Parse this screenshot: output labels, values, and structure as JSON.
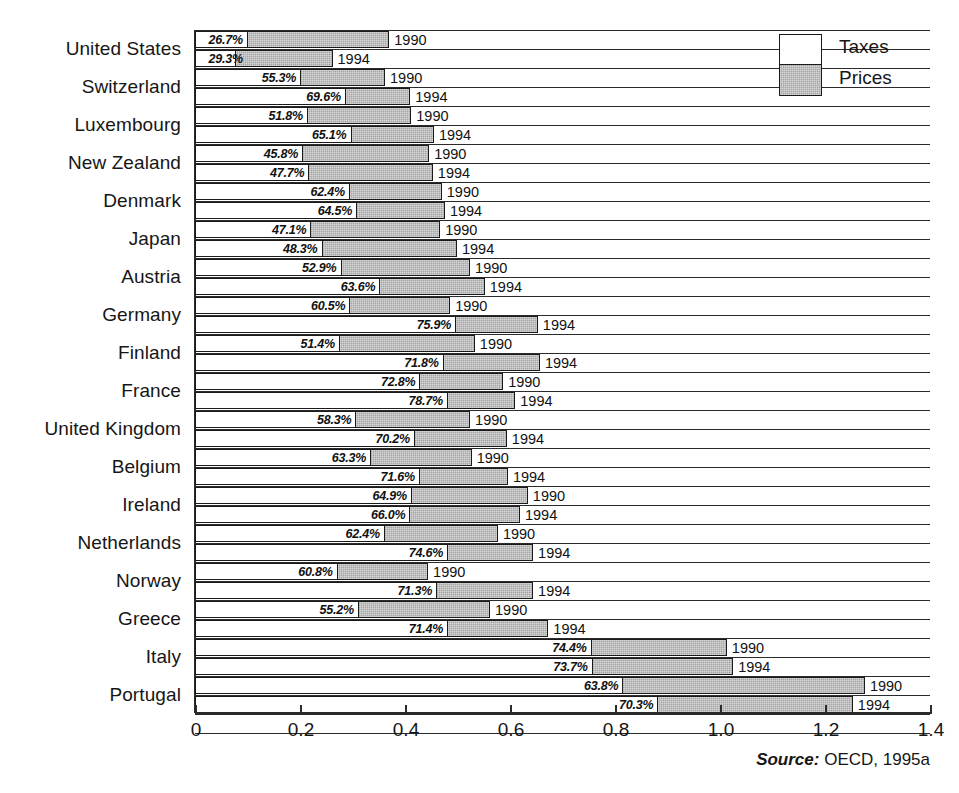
{
  "legend": {
    "position": "top-right",
    "entries": [
      {
        "label": "Taxes",
        "color": "#ffffff",
        "swatch": "white"
      },
      {
        "label": "Prices",
        "color": "#a6a6a6",
        "swatch": "gray"
      }
    ]
  },
  "source": {
    "term": "Source:",
    "text": " OECD, 1995a"
  },
  "axis": {
    "tick_labels": [
      "0",
      "0.2",
      "0.4",
      "0.6",
      "0.8",
      "1.0",
      "1.2",
      "1.4"
    ],
    "tick_values": [
      0,
      0.2,
      0.4,
      0.6,
      0.8,
      1.0,
      1.2,
      1.4
    ],
    "min": 0,
    "max": 1.4
  },
  "years": [
    "1990",
    "1994"
  ],
  "chart_data": {
    "type": "bar",
    "orientation": "horizontal",
    "stacked": true,
    "title": "",
    "subtitle": "",
    "xlabel": "",
    "ylabel": "",
    "xlim": [
      0,
      1.4
    ],
    "grid": false,
    "legend_position": "top-right",
    "series": [
      {
        "name": "Taxes",
        "color": "#ffffff"
      },
      {
        "name": "Prices",
        "color": "#a6a6a6"
      }
    ],
    "categories": [
      "United States",
      "Switzerland",
      "Luxembourg",
      "New Zealand",
      "Denmark",
      "Japan",
      "Austria",
      "Germany",
      "Finland",
      "France",
      "United Kingdom",
      "Belgium",
      "Ireland",
      "Netherlands",
      "Norway",
      "Greece",
      "Italy",
      "Portugal"
    ],
    "bars": [
      {
        "category": "United States",
        "year": "1990",
        "tax_share_label": "26.7%",
        "tax_share": 26.7,
        "total": 0.37
      },
      {
        "category": "United States",
        "year": "1994",
        "tax_share_label": "29.3%",
        "tax_share": 29.3,
        "total": 0.262
      },
      {
        "category": "Switzerland",
        "year": "1990",
        "tax_share_label": "55.3%",
        "tax_share": 55.3,
        "total": 0.362
      },
      {
        "category": "Switzerland",
        "year": "1994",
        "tax_share_label": "69.6%",
        "tax_share": 69.6,
        "total": 0.41
      },
      {
        "category": "Luxembourg",
        "year": "1990",
        "tax_share_label": "51.8%",
        "tax_share": 51.8,
        "total": 0.412
      },
      {
        "category": "Luxembourg",
        "year": "1994",
        "tax_share_label": "65.1%",
        "tax_share": 65.1,
        "total": 0.455
      },
      {
        "category": "New Zealand",
        "year": "1990",
        "tax_share_label": "45.8%",
        "tax_share": 45.8,
        "total": 0.446
      },
      {
        "category": "New Zealand",
        "year": "1994",
        "tax_share_label": "47.7%",
        "tax_share": 47.7,
        "total": 0.453
      },
      {
        "category": "Denmark",
        "year": "1990",
        "tax_share_label": "62.4%",
        "tax_share": 62.4,
        "total": 0.47
      },
      {
        "category": "Denmark",
        "year": "1994",
        "tax_share_label": "64.5%",
        "tax_share": 64.5,
        "total": 0.476
      },
      {
        "category": "Japan",
        "year": "1990",
        "tax_share_label": "47.1%",
        "tax_share": 47.1,
        "total": 0.467
      },
      {
        "category": "Japan",
        "year": "1994",
        "tax_share_label": "48.3%",
        "tax_share": 48.3,
        "total": 0.499
      },
      {
        "category": "Austria",
        "year": "1990",
        "tax_share_label": "52.9%",
        "tax_share": 52.9,
        "total": 0.524
      },
      {
        "category": "Austria",
        "year": "1994",
        "tax_share_label": "63.6%",
        "tax_share": 63.6,
        "total": 0.552
      },
      {
        "category": "Germany",
        "year": "1990",
        "tax_share_label": "60.5%",
        "tax_share": 60.5,
        "total": 0.486
      },
      {
        "category": "Germany",
        "year": "1994",
        "tax_share_label": "75.9%",
        "tax_share": 75.9,
        "total": 0.653
      },
      {
        "category": "Finland",
        "year": "1990",
        "tax_share_label": "51.4%",
        "tax_share": 51.4,
        "total": 0.533
      },
      {
        "category": "Finland",
        "year": "1994",
        "tax_share_label": "71.8%",
        "tax_share": 71.8,
        "total": 0.657
      },
      {
        "category": "France",
        "year": "1990",
        "tax_share_label": "72.8%",
        "tax_share": 72.8,
        "total": 0.587
      },
      {
        "category": "France",
        "year": "1994",
        "tax_share_label": "78.7%",
        "tax_share": 78.7,
        "total": 0.61
      },
      {
        "category": "United Kingdom",
        "year": "1990",
        "tax_share_label": "58.3%",
        "tax_share": 58.3,
        "total": 0.524
      },
      {
        "category": "United Kingdom",
        "year": "1994",
        "tax_share_label": "70.2%",
        "tax_share": 70.2,
        "total": 0.594
      },
      {
        "category": "Belgium",
        "year": "1990",
        "tax_share_label": "63.3%",
        "tax_share": 63.3,
        "total": 0.527
      },
      {
        "category": "Belgium",
        "year": "1994",
        "tax_share_label": "71.6%",
        "tax_share": 71.6,
        "total": 0.596
      },
      {
        "category": "Ireland",
        "year": "1990",
        "tax_share_label": "64.9%",
        "tax_share": 64.9,
        "total": 0.634
      },
      {
        "category": "Ireland",
        "year": "1994",
        "tax_share_label": "66.0%",
        "tax_share": 66.0,
        "total": 0.619
      },
      {
        "category": "Netherlands",
        "year": "1990",
        "tax_share_label": "62.4%",
        "tax_share": 62.4,
        "total": 0.577
      },
      {
        "category": "Netherlands",
        "year": "1994",
        "tax_share_label": "74.6%",
        "tax_share": 74.6,
        "total": 0.644
      },
      {
        "category": "Norway",
        "year": "1990",
        "tax_share_label": "60.8%",
        "tax_share": 60.8,
        "total": 0.444
      },
      {
        "category": "Norway",
        "year": "1994",
        "tax_share_label": "71.3%",
        "tax_share": 71.3,
        "total": 0.644
      },
      {
        "category": "Greece",
        "year": "1990",
        "tax_share_label": "55.2%",
        "tax_share": 55.2,
        "total": 0.562
      },
      {
        "category": "Greece",
        "year": "1994",
        "tax_share_label": "71.4%",
        "tax_share": 71.4,
        "total": 0.673
      },
      {
        "category": "Italy",
        "year": "1990",
        "tax_share_label": "74.4%",
        "tax_share": 74.4,
        "total": 1.013
      },
      {
        "category": "Italy",
        "year": "1994",
        "tax_share_label": "73.7%",
        "tax_share": 73.7,
        "total": 1.025
      },
      {
        "category": "Portugal",
        "year": "1990",
        "tax_share_label": "63.8%",
        "tax_share": 63.8,
        "total": 1.276
      },
      {
        "category": "Portugal",
        "year": "1994",
        "tax_share_label": "70.3%",
        "tax_share": 70.3,
        "total": 1.253
      }
    ]
  }
}
